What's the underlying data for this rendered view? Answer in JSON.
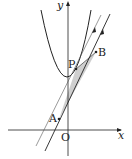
{
  "diagram": {
    "type": "coordinate-geometry",
    "axes": {
      "x_label": "x",
      "y_label": "y",
      "origin_label": "O"
    },
    "points": [
      {
        "name": "P",
        "label": "P"
      },
      {
        "name": "A",
        "label": "A"
      },
      {
        "name": "B",
        "label": "B"
      }
    ],
    "curves": [
      {
        "name": "parabola",
        "description": "upward-opening parabola with vertex on positive y-axis"
      }
    ],
    "lines": [
      {
        "name": "line-AB",
        "description": "line through A and B"
      },
      {
        "name": "tangent-at-P",
        "description": "line through P parallel to AB"
      }
    ],
    "shaded_region": "triangle PAB region between parabola and line AB",
    "colors": {
      "stroke": "#222222",
      "shade": "#cfcfcf"
    }
  }
}
